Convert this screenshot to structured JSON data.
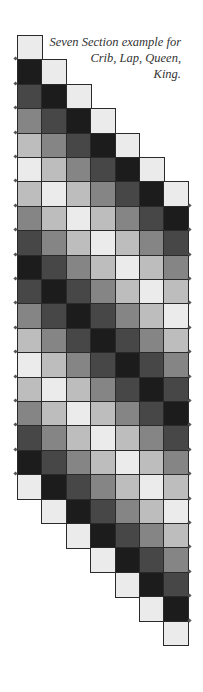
{
  "caption": {
    "lines": [
      "Seven Section example for",
      "Crib, Lap, Queen,",
      "King."
    ]
  },
  "palette": {
    "W": "#ebebeb",
    "L": "#bdbdbd",
    "M": "#858585",
    "D": "#474747",
    "B": "#1c1c1c",
    "border": "#2a2a2a"
  },
  "layout": {
    "origin_x": 17,
    "origin_y": 35,
    "cell_w": 24.4,
    "cell_h": 24.4,
    "columns": 7,
    "cells_per_column": 19
  },
  "columns": [
    [
      "W",
      "B",
      "D",
      "M",
      "L",
      "W",
      "L",
      "M",
      "D",
      "B",
      "D",
      "M",
      "L",
      "W",
      "L",
      "M",
      "D",
      "B",
      "W"
    ],
    [
      "W",
      "B",
      "D",
      "M",
      "L",
      "W",
      "L",
      "M",
      "D",
      "B",
      "D",
      "M",
      "L",
      "W",
      "L",
      "M",
      "D",
      "B",
      "W"
    ],
    [
      "W",
      "B",
      "D",
      "M",
      "L",
      "W",
      "L",
      "M",
      "D",
      "B",
      "D",
      "M",
      "L",
      "W",
      "L",
      "M",
      "D",
      "B",
      "W"
    ],
    [
      "W",
      "B",
      "D",
      "M",
      "L",
      "W",
      "L",
      "M",
      "D",
      "B",
      "D",
      "M",
      "L",
      "W",
      "L",
      "M",
      "D",
      "B",
      "W"
    ],
    [
      "W",
      "B",
      "D",
      "M",
      "L",
      "W",
      "L",
      "M",
      "D",
      "B",
      "D",
      "M",
      "L",
      "W",
      "L",
      "M",
      "D",
      "B",
      "W"
    ],
    [
      "W",
      "B",
      "D",
      "M",
      "L",
      "W",
      "L",
      "M",
      "D",
      "B",
      "D",
      "M",
      "L",
      "W",
      "L",
      "M",
      "D",
      "B",
      "W"
    ],
    [
      "W",
      "B",
      "D",
      "M",
      "L",
      "W",
      "L",
      "M",
      "D",
      "B",
      "D",
      "M",
      "L",
      "W",
      "L",
      "M",
      "D",
      "B",
      "W"
    ]
  ]
}
